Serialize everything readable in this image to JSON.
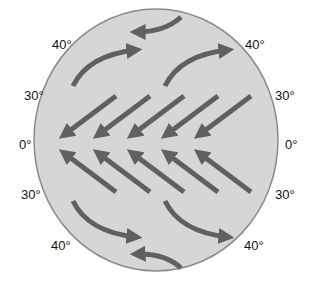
{
  "diagram": {
    "colors": {
      "globe_fill": "#d6d6d6",
      "globe_stroke": "#8a8a8a",
      "arrow": "#606060",
      "label": "#111111"
    },
    "labels": {
      "left_40_north": "40°",
      "left_30_north": "30°",
      "left_equator": "0°",
      "left_30_south": "30°",
      "left_40_south": "40°",
      "right_40_north": "40°",
      "right_30_north": "30°",
      "right_equator": "0°",
      "right_30_south": "30°",
      "right_40_south": "40°"
    },
    "arrow_groups": [
      {
        "name": "polar-easterlies-north",
        "direction": "west",
        "count": 1
      },
      {
        "name": "westerlies-north",
        "direction": "east",
        "count": 2
      },
      {
        "name": "northeast-trades",
        "direction": "southwest",
        "count": 5
      },
      {
        "name": "southeast-trades",
        "direction": "northwest",
        "count": 5
      },
      {
        "name": "westerlies-south",
        "direction": "east",
        "count": 2
      },
      {
        "name": "polar-easterlies-south",
        "direction": "west",
        "count": 1
      }
    ]
  }
}
